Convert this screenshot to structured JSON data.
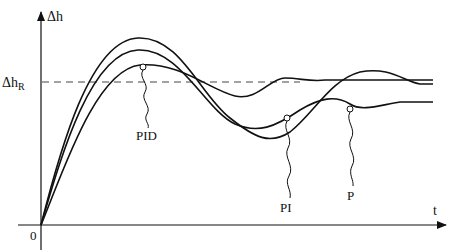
{
  "diagram": {
    "axes": {
      "y_label": "Δh",
      "x_label": "t",
      "origin_label": "0",
      "reference_label_main": "Δh",
      "reference_label_sub": "R"
    },
    "curves": [
      {
        "id": "P",
        "label": "P",
        "description": "largest overshoot, offset below reference"
      },
      {
        "id": "PI",
        "label": "PI",
        "description": "oscillating, settles to reference"
      },
      {
        "id": "PID",
        "label": "PID",
        "description": "smallest overshoot, settles to reference fastest"
      }
    ],
    "colors": {
      "line": "#111111",
      "background": "#ffffff"
    }
  }
}
